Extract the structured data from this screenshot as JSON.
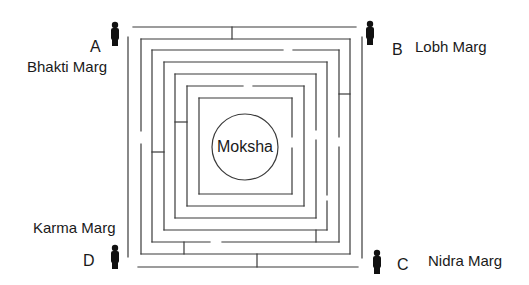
{
  "diagram": {
    "center": {
      "label": "Moksha",
      "cx": 245,
      "cy": 147,
      "r": 33
    },
    "paths": [
      {
        "letter": "A",
        "name": "Bhakti Marg",
        "corner": "top-left"
      },
      {
        "letter": "B",
        "name": "Lobh Marg",
        "corner": "top-right"
      },
      {
        "letter": "C",
        "name": "Nidra Marg",
        "corner": "bottom-right"
      },
      {
        "letter": "D",
        "name": "Karma Marg",
        "corner": "bottom-left"
      }
    ],
    "figure_icon": "person-silhouette-icon",
    "colors": {
      "line": "#3a3a3a",
      "text": "#1a1a1a",
      "figure": "#111111",
      "background": "#ffffff"
    }
  }
}
